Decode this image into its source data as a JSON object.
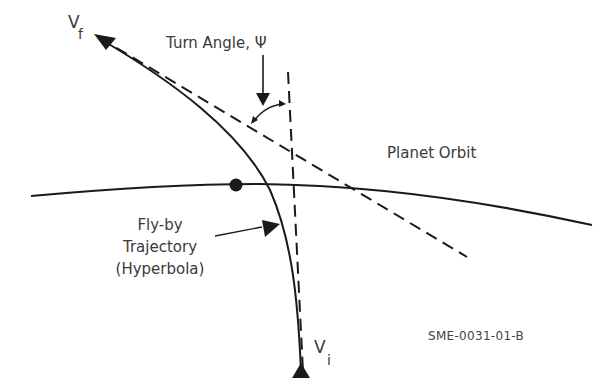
{
  "diagram": {
    "labels": {
      "v_final": "V",
      "v_final_sub": "f",
      "v_initial": "V",
      "v_initial_sub": "i",
      "turn_angle": "Turn Angle, Ψ",
      "planet_orbit": "Planet Orbit",
      "trajectory_line1": "Fly-by",
      "trajectory_line2": "Trajectory",
      "trajectory_line3": "(Hyperbola)",
      "figure_code": "SME-0031-01-B"
    },
    "elements": {
      "planet": "filled-circle",
      "orbit": "solid-curve",
      "trajectory": "solid-hyperbola",
      "asymptotes": [
        "dashed-line-outgoing",
        "dashed-line-incoming"
      ],
      "angle_marker": "curved-double-arrow"
    },
    "colors": {
      "stroke": "#1a1a1a",
      "text": "#3a3a3a"
    }
  }
}
